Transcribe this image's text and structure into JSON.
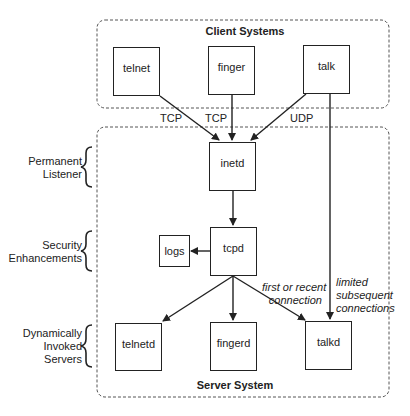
{
  "client_group": {
    "title": "Client Systems"
  },
  "server_group": {
    "title": "Server System"
  },
  "clients": [
    {
      "id": "telnet",
      "label": "telnet"
    },
    {
      "id": "finger",
      "label": "finger"
    },
    {
      "id": "talk",
      "label": "talk"
    }
  ],
  "server_nodes": {
    "inetd": "inetd",
    "tcpd": "tcpd",
    "logs": "logs",
    "telnetd": "telnetd",
    "fingerd": "fingerd",
    "talkd": "talkd"
  },
  "edge_labels": {
    "telnet_tcp": "TCP",
    "finger_tcp": "TCP",
    "talk_udp": "UDP",
    "first_connection": [
      "first or recent",
      "connection"
    ],
    "limited_connections": [
      "limited",
      "subsequent",
      "connections"
    ]
  },
  "side_labels": {
    "permanent_listener": [
      "Permanent",
      "Listener"
    ],
    "security_enhancements": [
      "Security",
      "Enhancements"
    ],
    "dynamic_servers": [
      "Dynamically",
      "Invoked",
      "Servers"
    ]
  },
  "colors": {
    "stroke": "#222222",
    "dashed": "#555555",
    "background": "#ffffff"
  }
}
